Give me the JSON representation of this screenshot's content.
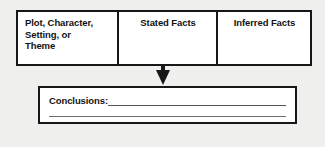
{
  "worksheet": {
    "background_color": "#efefee",
    "ink_color": "#171717",
    "paper_color": "#ffffff",
    "rule_color": "#555557"
  },
  "facts_table": {
    "columns": [
      {
        "label": "Plot, Character,\nSetting, or\nTheme",
        "align": "left"
      },
      {
        "label": "Stated Facts",
        "align": "center"
      },
      {
        "label": "Inferred Facts",
        "align": "center"
      }
    ]
  },
  "connector": {
    "icon": "down-arrow-icon"
  },
  "conclusions": {
    "label": "Conclusions:",
    "line_1_value": "",
    "line_2_value": ""
  }
}
